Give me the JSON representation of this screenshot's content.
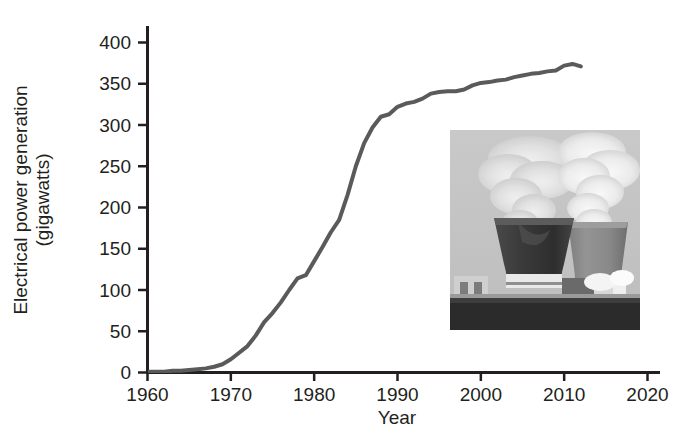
{
  "figure": {
    "background_color": "#ffffff",
    "text_color": "#231f20"
  },
  "chart_data": {
    "type": "line",
    "title": "",
    "subtitle": "",
    "xlabel": "Year",
    "ylabel": "Electrical power generation (gigawatts)",
    "ylabel_line1": "Electrical power generation",
    "ylabel_line2": "(gigawatts)",
    "xlim": [
      1960,
      2020
    ],
    "ylim": [
      0,
      400
    ],
    "xticks": [
      1960,
      1970,
      1980,
      1990,
      2000,
      2010,
      2020
    ],
    "xtick_labels": [
      "1960",
      "1970",
      "1980",
      "1990",
      "2000",
      "2010",
      "2020"
    ],
    "yticks": [
      0,
      50,
      100,
      150,
      200,
      250,
      300,
      350,
      400
    ],
    "ytick_labels": [
      "0",
      "50",
      "100",
      "150",
      "200",
      "250",
      "300",
      "350",
      "400"
    ],
    "grid": false,
    "legend": false,
    "legend_position": "none",
    "series": [
      {
        "name": "Nuclear electrical power generation",
        "color": "#5a5a5a",
        "line_width": 4,
        "x": [
          1960,
          1961,
          1962,
          1963,
          1964,
          1965,
          1966,
          1967,
          1968,
          1969,
          1970,
          1971,
          1972,
          1973,
          1974,
          1975,
          1976,
          1977,
          1978,
          1979,
          1980,
          1981,
          1982,
          1983,
          1984,
          1985,
          1986,
          1987,
          1988,
          1989,
          1990,
          1991,
          1992,
          1993,
          1994,
          1995,
          1996,
          1997,
          1998,
          1999,
          2000,
          2001,
          2002,
          2003,
          2004,
          2005,
          2006,
          2007,
          2008,
          2009,
          2010,
          2011,
          2012
        ],
        "y": [
          1,
          1,
          1,
          2,
          2,
          3,
          4,
          5,
          7,
          10,
          16,
          24,
          32,
          45,
          61,
          72,
          85,
          100,
          114,
          118,
          135,
          152,
          170,
          185,
          215,
          250,
          278,
          297,
          310,
          313,
          322,
          326,
          328,
          332,
          338,
          340,
          341,
          341,
          343,
          348,
          351,
          352,
          354,
          355,
          358,
          360,
          362,
          363,
          365,
          366,
          372,
          374,
          371
        ]
      }
    ]
  },
  "inset": {
    "name": "nuclear-power-plant-photo",
    "description": "Black and white photograph of a nuclear power plant with two large cooling towers emitting plumes of steam, low industrial buildings along the base",
    "position": {
      "left": 450,
      "top": 130,
      "width": 190,
      "height": 200
    }
  }
}
